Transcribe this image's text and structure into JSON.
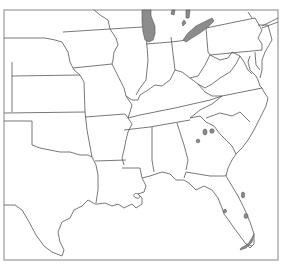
{
  "map": {
    "type": "outline map",
    "region": "Central and Eastern United States",
    "colors": {
      "background": "#ffffff",
      "state_border": "#555555",
      "frame": "#9a9a9a",
      "highlight_fill": "#8c8c8c"
    },
    "highlighted_areas": [
      {
        "name": "lake-michigan-area"
      },
      {
        "name": "lake-erie-area"
      },
      {
        "name": "georgia-sc-spots"
      },
      {
        "name": "florida-east-coast-spot"
      },
      {
        "name": "florida-interior-spot"
      },
      {
        "name": "florida-keys-spot"
      }
    ]
  }
}
